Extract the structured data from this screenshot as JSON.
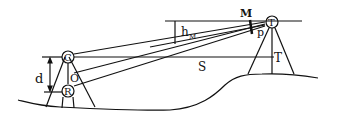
{
  "diagram": {
    "type": "surveying geometry (trigonometric levelling between two stations)",
    "labels": {
      "d": "d",
      "C": "C",
      "O": "O",
      "R": "R",
      "h": "h",
      "h_sub": "M",
      "M": "M",
      "T_station": "T",
      "p": "p",
      "S": "S",
      "T_ground": "T"
    },
    "colors": {
      "ink": "#111111",
      "background": "#ffffff"
    }
  }
}
